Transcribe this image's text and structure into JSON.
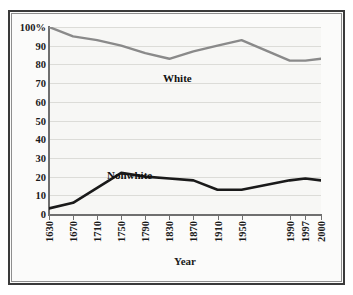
{
  "chart_data": {
    "type": "line",
    "title": "",
    "xlabel": "Year",
    "ylabel": "",
    "ylim": [
      0,
      100
    ],
    "xlim_index": [
      0,
      11
    ],
    "grid": true,
    "legend_position": "inline-annotations",
    "categories": [
      "1630",
      "1670",
      "1710",
      "1750",
      "1790",
      "1830",
      "1870",
      "1910",
      "1950",
      "1990",
      "1997",
      "2000"
    ],
    "ytick_labels": [
      "100%",
      "90",
      "80",
      "70",
      "60",
      "50",
      "40",
      "30",
      "20",
      "10",
      "0"
    ],
    "ytick_values": [
      100,
      90,
      80,
      70,
      60,
      50,
      40,
      30,
      20,
      10,
      0
    ],
    "series": [
      {
        "name": "White",
        "color": "#8a8a8a",
        "values": [
          100,
          95,
          93,
          90,
          86,
          83,
          87,
          90,
          93,
          82,
          82,
          83
        ]
      },
      {
        "name": "Nonwhite",
        "color": "#1a1a1a",
        "values": [
          3,
          6,
          14,
          22,
          20,
          19,
          18,
          13,
          13,
          18,
          19,
          18
        ]
      }
    ],
    "annotations": [
      {
        "text": "White",
        "series": "White"
      },
      {
        "text": "Nonwhite",
        "series": "Nonwhite"
      }
    ]
  },
  "figure": {
    "background": "#ffffff",
    "plot_background": "#f7f7f5",
    "frame_color": "#3a3a3a",
    "gridline_color": "#dcdcd8",
    "axis_color": "#6f6f6f"
  }
}
